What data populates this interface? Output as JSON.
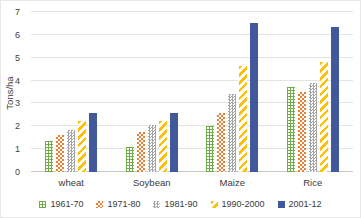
{
  "chart_data": {
    "type": "bar",
    "title": "",
    "xlabel": "",
    "ylabel": "Tons/ha",
    "ylim": [
      0,
      7
    ],
    "yticks": [
      0,
      1,
      2,
      3,
      4,
      5,
      6,
      7
    ],
    "grid": true,
    "legend_position": "bottom",
    "categories": [
      "wheat",
      "Soybean",
      "Maize",
      "Rice"
    ],
    "series": [
      {
        "name": "1961-70",
        "pattern": "p-green",
        "color": "#70ad47",
        "values": [
          1.35,
          1.1,
          2.0,
          3.7
        ]
      },
      {
        "name": "1971-80",
        "pattern": "p-orange",
        "color": "#ed7d31",
        "values": [
          1.6,
          1.75,
          2.6,
          3.5
        ]
      },
      {
        "name": "1981-90",
        "pattern": "p-gray",
        "color": "#a5a5a5",
        "values": [
          1.85,
          2.05,
          3.4,
          3.9
        ]
      },
      {
        "name": "1990-2000",
        "pattern": "p-yellow",
        "color": "#ffc000",
        "values": [
          2.25,
          2.25,
          4.65,
          4.8
        ]
      },
      {
        "name": "2001-12",
        "pattern": "p-blue",
        "color": "#41589b",
        "values": [
          2.6,
          2.6,
          6.5,
          6.35
        ]
      }
    ]
  }
}
